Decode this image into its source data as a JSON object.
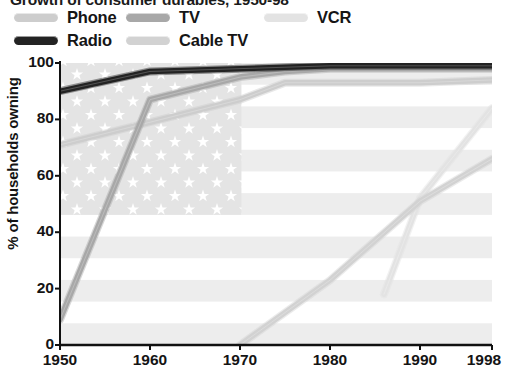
{
  "title": "Growth of consumer durables, 1950-98",
  "legend": {
    "items": [
      {
        "label": "Phone",
        "color": "#cdcdcd",
        "key": "phone"
      },
      {
        "label": "TV",
        "color": "#a8a8a8",
        "key": "tv"
      },
      {
        "label": "VCR",
        "color": "#e3e3e3",
        "key": "vcr"
      },
      {
        "label": "Radio",
        "color": "#232323",
        "key": "radio"
      },
      {
        "label": "Cable TV",
        "color": "#d2d2d2",
        "key": "cable_tv"
      }
    ]
  },
  "axes": {
    "ylabel": "% of households owning",
    "yticks": [
      "100",
      "80",
      "60",
      "40",
      "20",
      "0"
    ],
    "xticks": [
      "1950",
      "1960",
      "1970",
      "1980",
      "1990",
      "1998"
    ]
  },
  "background": {
    "motif": "us-flag",
    "stripe_color": "#ededed",
    "canton_color": "#e4e4e4",
    "star_color": "#ffffff"
  },
  "chart_data": {
    "type": "line",
    "title": "Growth of consumer durables, 1950-98",
    "xlabel": "",
    "ylabel": "% of households owning",
    "xlim": [
      1950,
      1998
    ],
    "ylim": [
      0,
      100
    ],
    "yticks": [
      0,
      20,
      40,
      60,
      80,
      100
    ],
    "xticks": [
      1950,
      1960,
      1970,
      1980,
      1990,
      1998
    ],
    "grid": false,
    "legend_position": "top",
    "series": [
      {
        "name": "Radio",
        "color": "#232323",
        "x": [
          1950,
          1960,
          1970,
          1980,
          1990,
          1998
        ],
        "y": [
          90,
          97,
          98,
          99,
          99,
          99
        ]
      },
      {
        "name": "TV",
        "color": "#a8a8a8",
        "x": [
          1950,
          1960,
          1970,
          1975,
          1980,
          1990,
          1998
        ],
        "y": [
          9,
          87,
          95,
          97,
          98,
          98,
          98
        ]
      },
      {
        "name": "Phone",
        "color": "#cdcdcd",
        "x": [
          1950,
          1960,
          1970,
          1975,
          1980,
          1990,
          1998
        ],
        "y": [
          71,
          79,
          87,
          93,
          93,
          93,
          94
        ]
      },
      {
        "name": "Cable TV",
        "color": "#d2d2d2",
        "x": [
          1970,
          1980,
          1990,
          1998
        ],
        "y": [
          0,
          23,
          51,
          66
        ]
      },
      {
        "name": "VCR",
        "color": "#e3e3e3",
        "x": [
          1986,
          1990,
          1998
        ],
        "y": [
          18,
          52,
          84
        ]
      }
    ]
  }
}
